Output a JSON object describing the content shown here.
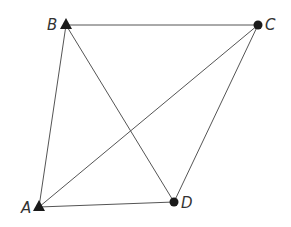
{
  "diagram": {
    "type": "quadrilateral-with-diagonals",
    "colors": {
      "line": "#555555",
      "marker": "#1a1a1a",
      "label": "#333333"
    },
    "points": [
      {
        "id": "A",
        "label": "A",
        "marker": "triangle",
        "x": 39,
        "y": 207
      },
      {
        "id": "B",
        "label": "B",
        "marker": "triangle",
        "x": 66,
        "y": 25
      },
      {
        "id": "C",
        "label": "C",
        "marker": "dot",
        "x": 258,
        "y": 25
      },
      {
        "id": "D",
        "label": "D",
        "marker": "dot",
        "x": 174,
        "y": 202
      }
    ],
    "edges": [
      [
        "A",
        "B"
      ],
      [
        "B",
        "C"
      ],
      [
        "C",
        "D"
      ],
      [
        "D",
        "A"
      ],
      [
        "A",
        "C"
      ],
      [
        "B",
        "D"
      ]
    ]
  }
}
